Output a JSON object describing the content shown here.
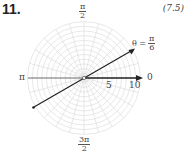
{
  "problem": {
    "number": "11.",
    "reference": "(7.5)"
  },
  "chart_data": {
    "type": "polar-graph",
    "title": "",
    "angle_labels": {
      "top": {
        "num": "π",
        "den": "2"
      },
      "left": "π",
      "right": "0",
      "bottom": {
        "num": "3π",
        "den": "2"
      }
    },
    "radial_ticks": [
      "5",
      "10"
    ],
    "radial_max": 12,
    "radial_step": 1,
    "spoke_step_deg": 15,
    "line": {
      "equation_lhs": "θ =",
      "equation_num": "π",
      "equation_den": "6",
      "angle_rad": 0.5236,
      "description": "line through pole at angle π/6"
    },
    "colors": {
      "grid": "#d8d8d8",
      "axis": "#222222",
      "line": "#222222",
      "text": "#444444"
    }
  }
}
